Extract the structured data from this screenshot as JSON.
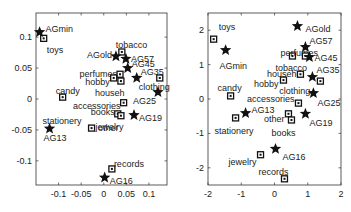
{
  "chart_data": [
    {
      "type": "scatter",
      "title": "",
      "xlabel": "",
      "ylabel": "",
      "xlim": [
        -0.15,
        0.14
      ],
      "ylim": [
        -0.139,
        0.139
      ],
      "xticks": [
        -0.1,
        -0.05,
        0,
        0.05,
        0.1
      ],
      "xtick_labels": [
        "-0.1",
        "-0.05",
        "0",
        "0.05",
        "0.1"
      ],
      "yticks": [
        0.1,
        0.05,
        0,
        -0.05,
        -0.1
      ],
      "ytick_labels": [
        "0.1",
        "0.05",
        "0",
        "-0.05",
        "-0.1"
      ],
      "grid": false,
      "legend": null,
      "series": [
        {
          "name": "categories",
          "marker": "square",
          "points": [
            {
              "label": "toys",
              "x": -0.133,
              "y": 0.098,
              "lx": 3,
              "ly": 12,
              "anchor": "start"
            },
            {
              "label": "candy",
              "x": -0.091,
              "y": 0.003,
              "lx": -7,
              "ly": -6,
              "anchor": "start"
            },
            {
              "label": "tobacco",
              "x": 0.04,
              "y": 0.076,
              "lx": -6,
              "ly": -7,
              "anchor": "start"
            },
            {
              "label": "perfumes",
              "x": 0.036,
              "y": 0.04,
              "lx": -3,
              "ly": 0,
              "anchor": "end"
            },
            {
              "label": "hobby",
              "x": 0.022,
              "y": 0.034,
              "lx": -4,
              "ly": 4,
              "anchor": "end"
            },
            {
              "label": "househ",
              "x": 0.038,
              "y": 0.029,
              "lx": -26,
              "ly": 12,
              "anchor": "start"
            },
            {
              "label": "clothing",
              "x": 0.124,
              "y": 0.034,
              "lx": -21,
              "ly": 9,
              "anchor": "start"
            },
            {
              "label": "accessories",
              "x": 0.044,
              "y": -0.006,
              "lx": -3,
              "ly": 3,
              "anchor": "end"
            },
            {
              "label": "books",
              "x": 0.031,
              "y": -0.024,
              "lx": -3,
              "ly": -2,
              "anchor": "end"
            },
            {
              "label": "other",
              "x": 0.038,
              "y": -0.027,
              "lx": -23,
              "ly": 12,
              "anchor": "start"
            },
            {
              "label": "jewelry",
              "x": -0.027,
              "y": -0.047,
              "lx": 4,
              "ly": -1,
              "anchor": "start"
            },
            {
              "label": "records",
              "x": 0.018,
              "y": -0.113,
              "lx": 2,
              "ly": -5,
              "anchor": "start"
            }
          ]
        },
        {
          "name": "aggregates",
          "marker": "star",
          "points": [
            {
              "label": "AGmin",
              "x": -0.142,
              "y": 0.108,
              "lx": 6,
              "ly": -3,
              "anchor": "start"
            },
            {
              "label": "AG13",
              "x": -0.12,
              "y": -0.048,
              "lx": -6,
              "ly": 9,
              "anchor": "start"
            },
            {
              "label": "AGold",
              "x": 0.027,
              "y": 0.069,
              "lx": -4,
              "ly": -1,
              "anchor": "end"
            },
            {
              "label": "AG57",
              "x": 0.049,
              "y": 0.065,
              "lx": 5,
              "ly": 0,
              "anchor": "start"
            },
            {
              "label": "AG45",
              "x": 0.053,
              "y": 0.05,
              "lx": 4,
              "ly": -4,
              "anchor": "start"
            },
            {
              "label": "AG35",
              "x": 0.073,
              "y": 0.034,
              "lx": 4,
              "ly": -6,
              "anchor": "start"
            },
            {
              "label": "AG25",
              "x": 0.12,
              "y": 0.011,
              "lx": -25,
              "ly": 9,
              "anchor": "start"
            },
            {
              "label": "AG19",
              "x": 0.067,
              "y": -0.026,
              "lx": 5,
              "ly": 3,
              "anchor": "start"
            },
            {
              "label": "AG16",
              "x": 0.002,
              "y": -0.127,
              "lx": 5,
              "ly": 3,
              "anchor": "start"
            }
          ]
        }
      ],
      "overlay_labels": [
        {
          "label": "stationery",
          "x": -0.12,
          "y": -0.048,
          "lx": -7,
          "ly": -8,
          "anchor": "start"
        }
      ],
      "frame_px": {
        "left": 36,
        "top": 13,
        "right": 167,
        "bottom": 185
      }
    },
    {
      "type": "scatter",
      "title": "",
      "xlabel": "",
      "ylabel": "",
      "xlim": [
        -2,
        2
      ],
      "ylim": [
        -2.5,
        2.5
      ],
      "xticks": [
        -2,
        -1,
        0,
        1,
        2
      ],
      "xtick_labels": [
        "-2",
        "-1",
        "0",
        "1",
        "2"
      ],
      "yticks": [
        2,
        1,
        0,
        -1,
        -2
      ],
      "ytick_labels": [
        "2",
        "1",
        "0",
        "-1",
        "-2"
      ],
      "grid": false,
      "legend": null,
      "series": [
        {
          "name": "categories",
          "marker": "square",
          "points": [
            {
              "label": "toys",
              "x": -1.83,
              "y": 1.74,
              "lx": 5,
              "ly": -12,
              "anchor": "start"
            },
            {
              "label": "perfumes",
              "x": 0.54,
              "y": 1.25,
              "lx": -12,
              "ly": -3,
              "anchor": "start"
            },
            {
              "label": "tobacco",
              "x": 0.93,
              "y": 1.25,
              "lx": -30,
              "ly": 12,
              "anchor": "start"
            },
            {
              "label": "househ",
              "x": 0.78,
              "y": 0.72,
              "lx": -4,
              "ly": 0,
              "anchor": "end"
            },
            {
              "label": "hobby",
              "x": 0.27,
              "y": 0.55,
              "lx": -5,
              "ly": 4,
              "anchor": "end"
            },
            {
              "label": "clothing",
              "x": 1.38,
              "y": 0.52,
              "lx": -10,
              "ly": 10,
              "anchor": "end"
            },
            {
              "label": "candy",
              "x": -1.32,
              "y": 0.09,
              "lx": -13,
              "ly": -8,
              "anchor": "start"
            },
            {
              "label": "accessories",
              "x": 0.72,
              "y": -0.12,
              "lx": -4,
              "ly": -4,
              "anchor": "end"
            },
            {
              "label": "stationery",
              "x": -1.17,
              "y": -0.55,
              "lx": -21,
              "ly": 13,
              "anchor": "start"
            },
            {
              "label": "other",
              "x": 0.42,
              "y": -0.43,
              "lx": -4,
              "ly": 5,
              "anchor": "end"
            },
            {
              "label": "books",
              "x": 0.51,
              "y": -0.61,
              "lx": -20,
              "ly": 13,
              "anchor": "start"
            },
            {
              "label": "jewelry",
              "x": -0.42,
              "y": -1.62,
              "lx": -4,
              "ly": 7,
              "anchor": "end"
            },
            {
              "label": "records",
              "x": 0.3,
              "y": -2.32,
              "lx": -26,
              "ly": -7,
              "anchor": "start"
            }
          ]
        },
        {
          "name": "aggregates",
          "marker": "star",
          "points": [
            {
              "label": "AGmin",
              "x": -1.47,
              "y": 1.42,
              "lx": -6,
              "ly": 16,
              "anchor": "start"
            },
            {
              "label": "AGold",
              "x": 0.69,
              "y": 2.12,
              "lx": 8,
              "ly": 3,
              "anchor": "start"
            },
            {
              "label": "AG57",
              "x": 0.93,
              "y": 1.51,
              "lx": 4,
              "ly": -6,
              "anchor": "start"
            },
            {
              "label": "AG45",
              "x": 1.05,
              "y": 1.22,
              "lx": 5,
              "ly": 1,
              "anchor": "start"
            },
            {
              "label": "AG35",
              "x": 1.14,
              "y": 0.64,
              "lx": 4,
              "ly": -7,
              "anchor": "start"
            },
            {
              "label": "AG25",
              "x": 1.17,
              "y": 0.17,
              "lx": 4,
              "ly": 10,
              "anchor": "start"
            },
            {
              "label": "AG13",
              "x": -0.87,
              "y": -0.41,
              "lx": 6,
              "ly": -3,
              "anchor": "start"
            },
            {
              "label": "AG19",
              "x": 0.93,
              "y": -0.43,
              "lx": 4,
              "ly": 9,
              "anchor": "start"
            },
            {
              "label": "AG16",
              "x": 0.03,
              "y": -1.45,
              "lx": 7,
              "ly": 8,
              "anchor": "start"
            }
          ]
        }
      ],
      "frame_px": {
        "left": 208,
        "top": 13,
        "right": 341,
        "bottom": 185
      }
    }
  ]
}
